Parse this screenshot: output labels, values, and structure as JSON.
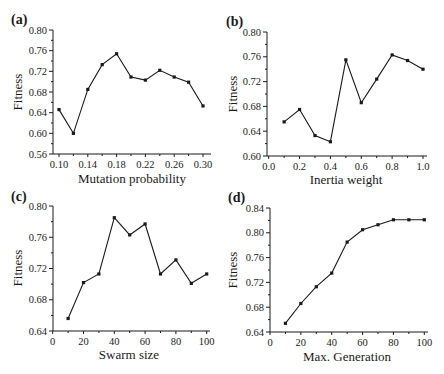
{
  "chart_data": [
    {
      "panel": "(a)",
      "type": "line",
      "xlabel": "Mutation probability",
      "ylabel": "Fitness",
      "x": [
        0.1,
        0.12,
        0.14,
        0.16,
        0.18,
        0.2,
        0.22,
        0.24,
        0.26,
        0.28,
        0.3
      ],
      "values": [
        0.646,
        0.6,
        0.685,
        0.733,
        0.754,
        0.709,
        0.703,
        0.722,
        0.709,
        0.699,
        0.653
      ],
      "xticks": [
        "0.10",
        "0.14",
        "0.18",
        "0.22",
        "0.26",
        "0.30"
      ],
      "xtick_values": [
        0.1,
        0.14,
        0.18,
        0.22,
        0.26,
        0.3
      ],
      "yticks": [
        "0.56",
        "0.60",
        "0.64",
        "0.68",
        "0.72",
        "0.76",
        "0.80"
      ],
      "ytick_values": [
        0.56,
        0.6,
        0.64,
        0.68,
        0.72,
        0.76,
        0.8
      ],
      "xlim": [
        0.087,
        0.311
      ],
      "ylim": [
        0.56,
        0.8
      ],
      "grid": false,
      "marker": "square",
      "color": "#1a1a1a"
    },
    {
      "panel": "(b)",
      "type": "line",
      "xlabel": "Inertia weight",
      "ylabel": "Fitness",
      "x": [
        0.1,
        0.2,
        0.3,
        0.4,
        0.5,
        0.6,
        0.7,
        0.8,
        0.9,
        1.0
      ],
      "values": [
        0.655,
        0.675,
        0.633,
        0.623,
        0.755,
        0.686,
        0.724,
        0.763,
        0.754,
        0.74
      ],
      "xticks": [
        "0.0",
        "0.2",
        "0.4",
        "0.6",
        "0.8",
        "1.0"
      ],
      "xtick_values": [
        0.0,
        0.2,
        0.4,
        0.6,
        0.8,
        1.0
      ],
      "yticks": [
        "0.60",
        "0.64",
        "0.68",
        "0.72",
        "0.76",
        "0.80"
      ],
      "ytick_values": [
        0.6,
        0.64,
        0.68,
        0.72,
        0.76,
        0.8
      ],
      "xlim": [
        -0.01,
        1.025
      ],
      "ylim": [
        0.6,
        0.8
      ],
      "grid": false,
      "marker": "square",
      "color": "#1a1a1a"
    },
    {
      "panel": "(c)",
      "type": "line",
      "xlabel": "Swarm size",
      "ylabel": "Fitness",
      "x": [
        10,
        20,
        30,
        40,
        50,
        60,
        70,
        80,
        90,
        100
      ],
      "values": [
        0.656,
        0.702,
        0.713,
        0.785,
        0.763,
        0.777,
        0.713,
        0.731,
        0.701,
        0.713
      ],
      "xticks": [
        "0",
        "20",
        "40",
        "60",
        "80",
        "100"
      ],
      "xtick_values": [
        0,
        20,
        40,
        60,
        80,
        100
      ],
      "yticks": [
        "0.64",
        "0.68",
        "0.72",
        "0.76",
        "0.80"
      ],
      "ytick_values": [
        0.64,
        0.68,
        0.72,
        0.76,
        0.8
      ],
      "xlim": [
        0,
        102
      ],
      "ylim": [
        0.64,
        0.8
      ],
      "grid": false,
      "marker": "square",
      "color": "#1a1a1a"
    },
    {
      "panel": "(d)",
      "type": "line",
      "xlabel": "Max. Generation",
      "ylabel": "Fitness",
      "x": [
        10,
        20,
        30,
        40,
        50,
        60,
        70,
        80,
        90,
        100
      ],
      "values": [
        0.654,
        0.686,
        0.713,
        0.735,
        0.785,
        0.805,
        0.813,
        0.821,
        0.821,
        0.821
      ],
      "xticks": [
        "0",
        "20",
        "40",
        "60",
        "80",
        "100"
      ],
      "xtick_values": [
        0,
        20,
        40,
        60,
        80,
        100
      ],
      "yticks": [
        "0.64",
        "0.68",
        "0.72",
        "0.76",
        "0.80",
        "0.84"
      ],
      "ytick_values": [
        0.64,
        0.68,
        0.72,
        0.76,
        0.8,
        0.84
      ],
      "xlim": [
        0,
        102
      ],
      "ylim": [
        0.64,
        0.84
      ],
      "grid": false,
      "marker": "square",
      "color": "#1a1a1a"
    }
  ],
  "layout": {
    "panels": [
      {
        "left": 53,
        "top": 30,
        "right": 211,
        "bottom": 154,
        "x0px": 59,
        "x1px": 203
      },
      {
        "left": 267,
        "top": 32,
        "right": 427,
        "bottom": 156,
        "x0px": 268.7,
        "x1px": 423
      },
      {
        "left": 53,
        "top": 206,
        "right": 210,
        "bottom": 331,
        "x0px": 52.7,
        "x1px": 206.7
      },
      {
        "left": 270,
        "top": 208,
        "right": 428,
        "bottom": 332,
        "x0px": 270,
        "x1px": 424.3
      }
    ]
  }
}
